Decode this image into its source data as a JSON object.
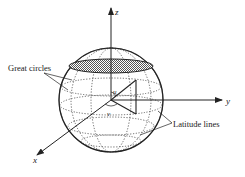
{
  "diagram": {
    "type": "sphere-coordinate-diagram",
    "axes": {
      "z": "z",
      "y": "y",
      "x": "x"
    },
    "angles": {
      "u": "u",
      "v": "v"
    },
    "annotations": {
      "great_circles": "Great circles",
      "latitude_lines": "Latitude lines"
    },
    "colors": {
      "ink": "#222222",
      "background": "#ffffff",
      "cap_fill": "#888888"
    }
  }
}
